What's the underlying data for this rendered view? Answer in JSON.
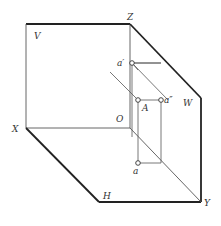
{
  "diagram": {
    "labels": {
      "V": "V",
      "Z": "Z",
      "W": "W",
      "X": "X",
      "O": "O",
      "H": "H",
      "Y": "Y",
      "a_prime": "a′",
      "a_double_prime": "a″",
      "A": "A",
      "a": "a"
    },
    "colors": {
      "thick_line": "#222222",
      "thin_line": "#555555",
      "text": "#333333"
    }
  }
}
